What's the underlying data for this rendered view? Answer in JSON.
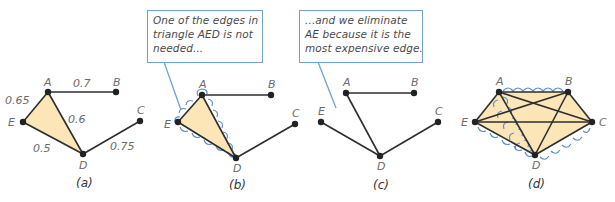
{
  "colors": {
    "fill": "#fce6b8",
    "edge": "#2e2e2e",
    "node": "#222222",
    "callout_border": "#6fa0d6",
    "wavy_highlight": "#5b8fd1",
    "label": "#6b6b6b"
  },
  "callouts": [
    {
      "id": "callout-b",
      "lines": [
        "One of the edges in",
        "triangle AED is not",
        "needed..."
      ]
    },
    {
      "id": "callout-c",
      "lines": [
        "...and we eliminate",
        "AE because it is the",
        "most expensive edge."
      ]
    }
  ],
  "panels": [
    {
      "caption": "(a)",
      "nodes": {
        "A": "A",
        "B": "B",
        "C": "C",
        "D": "D",
        "E": "E"
      },
      "edge_weights": {
        "AB": "0.7",
        "AE": "0.65",
        "AD": "0.6",
        "ED": "0.5",
        "DC": "0.75"
      }
    },
    {
      "caption": "(b)",
      "nodes": {
        "A": "A",
        "B": "B",
        "C": "C",
        "D": "D",
        "E": "E"
      }
    },
    {
      "caption": "(c)",
      "nodes": {
        "A": "A",
        "B": "B",
        "C": "C",
        "D": "D",
        "E": "E"
      }
    },
    {
      "caption": "(d)",
      "nodes": {
        "A": "A",
        "B": "B",
        "C": "C",
        "D": "D",
        "E": "E"
      }
    }
  ]
}
